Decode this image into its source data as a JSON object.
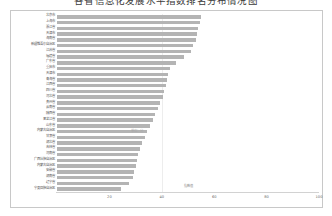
{
  "title": "各省信息化发展水平指数排名分布情况图",
  "chart_frame": {
    "background": "#ffffff",
    "border_color": "#c8c8c8"
  },
  "axis": {
    "xlabel": "指数值",
    "xticks": [
      "0",
      "20",
      "40",
      "60",
      "80",
      "100"
    ],
    "xtick_values": [
      0,
      20,
      40,
      60,
      80,
      100
    ],
    "xmin": 0,
    "xmax": 100,
    "gridline_values": [
      40
    ]
  },
  "annotation": "单位：分",
  "style": {
    "bar_color": "#b4b4b4",
    "gridline_color": "#ededed",
    "label_color": "#585858",
    "tick_color": "#6a6a6a"
  },
  "chart_data": {
    "type": "bar",
    "orientation": "horizontal",
    "title": "各省信息化发展水平指数排名分布情况图",
    "xlabel": "指数值",
    "ylabel": "",
    "xlim": [
      0,
      100
    ],
    "grid": true,
    "legend": false,
    "categories": [
      "北京市",
      "上海市",
      "浙江省",
      "天津市",
      "海南省",
      "新疆维吾尔自治区",
      "江苏省",
      "福建省",
      "广东省",
      "重庆市",
      "天津市",
      "青海省",
      "江西省",
      "四川省",
      "河北省",
      "贵州省",
      "云南省",
      "陕西省",
      "黑龙江省",
      "山东省",
      "内蒙古自治区",
      "甘肃省",
      "湖北省",
      "吉林省",
      "河南省",
      "广西壮族自治区",
      "内蒙古自治区",
      "安徽省",
      "湖南省",
      "辽宁省",
      "宁夏回族自治区"
    ],
    "values": [
      55.0,
      54.5,
      54.0,
      53.5,
      53.0,
      52.0,
      51.0,
      48.5,
      45.5,
      43.0,
      42.5,
      42.0,
      41.5,
      41.0,
      40.5,
      39.5,
      38.5,
      37.5,
      36.5,
      35.5,
      34.5,
      33.5,
      32.5,
      31.5,
      31.0,
      30.5,
      30.0,
      29.5,
      29.0,
      27.5,
      24.5
    ]
  }
}
